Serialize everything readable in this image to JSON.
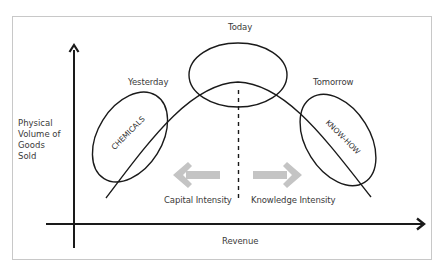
{
  "diagram": {
    "axes": {
      "y_label_lines": [
        "Physical",
        "Volume of",
        "Goods",
        "Sold"
      ],
      "x_label": "Revenue"
    },
    "phases": {
      "yesterday": {
        "title": "Yesterday",
        "tag": "CHEMICALS"
      },
      "today": {
        "title": "Today"
      },
      "tomorrow": {
        "title": "Tomorrow",
        "tag": "KNOW-HOW"
      }
    },
    "arrows": {
      "left_label": "Capital Intensity",
      "right_label": "Knowledge Intensity"
    },
    "colors": {
      "frame": "#c8c8c8",
      "line": "#222222",
      "arrow_grey": "#c4c4c4",
      "text": "#3a3a3a"
    }
  }
}
